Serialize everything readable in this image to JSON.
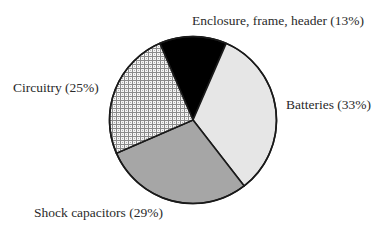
{
  "chart_data": {
    "type": "pie",
    "title": "",
    "start_angle_deg": -23.4,
    "direction": "clockwise",
    "slices": [
      {
        "label": "Enclosure, frame, header",
        "value": 13,
        "display": "Enclosure, frame, header (13%)",
        "fill": "#000000",
        "pattern": "solid"
      },
      {
        "label": "Batteries",
        "value": 33,
        "display": "Batteries (33%)",
        "fill": "#e6e6e6",
        "pattern": "solid"
      },
      {
        "label": "Shock capacitors",
        "value": 29,
        "display": "Shock capacitors (29%)",
        "fill": "#a6a6a6",
        "pattern": "solid"
      },
      {
        "label": "Circuitry",
        "value": 25,
        "display": "Circuitry (25%)",
        "fill": "#9c9c9c",
        "pattern": "crosshatch"
      }
    ],
    "legend": "none",
    "labels_position": "outside"
  },
  "labels": {
    "enclosure": "Enclosure, frame, header (13%)",
    "batteries": "Batteries (33%)",
    "shock": "Shock capacitors (29%)",
    "circuitry": "Circuitry (25%)"
  }
}
